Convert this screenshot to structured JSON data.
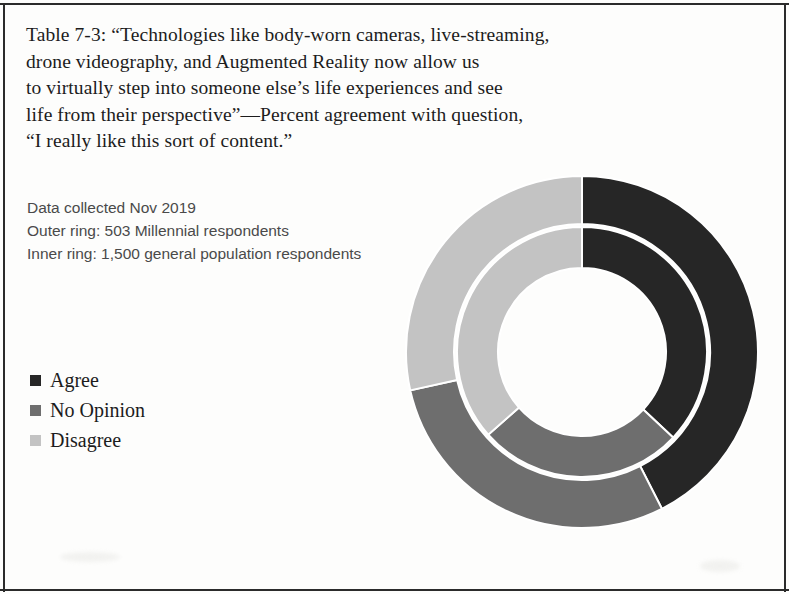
{
  "caption": {
    "lines": [
      "Table 7-3: “Technologies like body-worn cameras, live-streaming,",
      "drone videography, and Augmented Reality now allow us",
      "to virtually step into someone else’s life experiences and see",
      "life from their perspective”—Percent agreement with question,",
      "“I really like this sort of content.”"
    ]
  },
  "notes": {
    "lines": [
      "Data collected Nov 2019",
      "Outer ring: 503 Millennial respondents",
      "Inner ring: 1,500 general population respondents"
    ]
  },
  "legend": {
    "items": [
      {
        "label": "Agree",
        "color": "#262626"
      },
      {
        "label": "No Opinion",
        "color": "#6e6e6e"
      },
      {
        "label": "Disagree",
        "color": "#c3c3c3"
      }
    ]
  },
  "chart_data": {
    "type": "pie",
    "subtype": "nested-donut",
    "legend_position": "left",
    "categories": [
      "Agree",
      "No Opinion",
      "Disagree"
    ],
    "colors": [
      "#262626",
      "#6e6e6e",
      "#c3c3c3"
    ],
    "start_angle_deg": 0,
    "direction": "clockwise",
    "series": [
      {
        "name": "Outer ring: 503 Millennial respondents",
        "ring": "outer",
        "values": [
          42.5,
          29.0,
          28.5
        ],
        "unit": "percent"
      },
      {
        "name": "Inner ring: 1,500 general population respondents",
        "ring": "inner",
        "values": [
          37.0,
          26.5,
          36.5
        ],
        "unit": "percent"
      }
    ],
    "geometry": {
      "center_x": 182,
      "center_y": 184,
      "outer_ring_outer_radius": 176,
      "outer_ring_inner_radius": 128,
      "inner_ring_outer_radius": 125,
      "inner_ring_inner_radius": 84,
      "separator_color": "#ffffff"
    }
  }
}
